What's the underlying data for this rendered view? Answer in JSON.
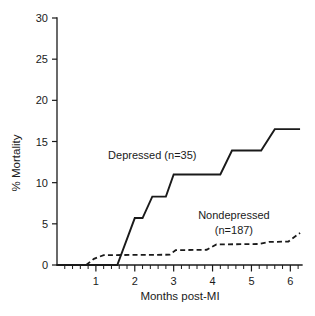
{
  "chart_data": {
    "type": "line",
    "title": "",
    "subtitle": "",
    "xlabel": "Months post-MI",
    "ylabel": "% Mortality",
    "xlim": [
      0,
      6.3
    ],
    "ylim": [
      0,
      30
    ],
    "grid": false,
    "legend_position": "inline-annotations",
    "y_ticks": [
      0,
      5,
      10,
      15,
      20,
      25,
      30
    ],
    "y_tick_labels": [
      "0",
      "5",
      "10",
      "15",
      "20",
      "25",
      "30"
    ],
    "x_ticks": [
      1,
      2,
      3,
      4,
      5,
      6
    ],
    "x_tick_labels": [
      "1",
      "2",
      "3",
      "4",
      "5",
      "6"
    ],
    "x_minor_tick_step": 0.2,
    "series": [
      {
        "name": "Depressed (n=35)",
        "style": "solid",
        "n": 35,
        "annotation": "Depressed (n=35)",
        "points": [
          [
            0.0,
            0.0
          ],
          [
            1.55,
            0.0
          ],
          [
            2.0,
            5.7
          ],
          [
            2.2,
            5.7
          ],
          [
            2.45,
            8.3
          ],
          [
            2.8,
            8.3
          ],
          [
            3.0,
            11.0
          ],
          [
            4.2,
            11.0
          ],
          [
            4.5,
            13.9
          ],
          [
            5.25,
            13.9
          ],
          [
            5.6,
            16.5
          ],
          [
            6.25,
            16.5
          ]
        ]
      },
      {
        "name": "Nondepressed (n=187)",
        "style": "dashed",
        "n": 187,
        "annotation": "Nondepressed\n(n=187)",
        "points": [
          [
            0.75,
            0.0
          ],
          [
            0.95,
            0.75
          ],
          [
            1.2,
            1.2
          ],
          [
            2.9,
            1.25
          ],
          [
            3.05,
            1.8
          ],
          [
            3.85,
            1.85
          ],
          [
            4.1,
            2.5
          ],
          [
            5.2,
            2.55
          ],
          [
            5.45,
            2.8
          ],
          [
            5.95,
            2.85
          ],
          [
            6.25,
            3.9
          ]
        ]
      }
    ],
    "annotations": [
      {
        "text": "Depressed (n=35)",
        "x": 2.45,
        "y": 12.9,
        "anchor": "middle"
      },
      {
        "text": "Nondepressed",
        "x": 4.55,
        "y": 5.6,
        "anchor": "middle"
      },
      {
        "text": "(n=187)",
        "x": 4.55,
        "y": 3.8,
        "anchor": "middle"
      }
    ]
  },
  "colors": {
    "ink": "#1a1a1a",
    "background": "#ffffff"
  }
}
